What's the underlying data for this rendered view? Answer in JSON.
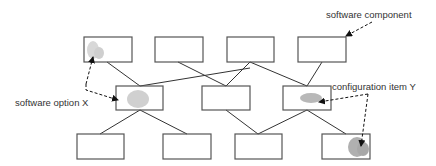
{
  "diagram": {
    "labels": {
      "software_component": "software component",
      "software_option": "software option X",
      "configuration_item": "configuration item Y"
    },
    "colors": {
      "line": "#333333",
      "box_border": "#555555",
      "blob": "#c8c8c8",
      "blob_dark": "#a8a8a8"
    },
    "rows": {
      "top": [
        "box-1",
        "box-2",
        "box-3",
        "box-4"
      ],
      "middle": [
        "box-a",
        "box-b",
        "box-c"
      ],
      "bottom": [
        "box-i",
        "box-ii",
        "box-iii",
        "box-iv"
      ]
    }
  }
}
